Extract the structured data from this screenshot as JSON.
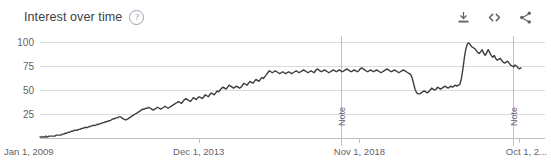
{
  "header": {
    "title": "Interest over time",
    "help_icon_glyph": "?",
    "help_icon_name": "help-icon",
    "actions": [
      {
        "name": "download-icon",
        "label": "download"
      },
      {
        "name": "embed-icon",
        "label": "embed"
      },
      {
        "name": "share-icon",
        "label": "share"
      }
    ]
  },
  "colors": {
    "line": "#3c4043",
    "gridline": "#dadce0",
    "axis": "#bdc1c6",
    "text": "#5f6368",
    "title": "#3c4043",
    "background": "#ffffff"
  },
  "annotations": [
    {
      "label": "Note",
      "x_value": 59.7
    },
    {
      "label": "Note",
      "x_value": 93.6
    }
  ],
  "chart_data": {
    "type": "line",
    "title": "Interest over time",
    "xlabel": "",
    "ylabel": "",
    "ylim": [
      0,
      100
    ],
    "grid": true,
    "legend": false,
    "y_ticks": [
      100,
      75,
      50,
      25
    ],
    "x_ticks": [
      "Jan 1, 2009",
      "Dec 1, 2013",
      "Nov 1, 2018",
      "Oct 1, 2..."
    ],
    "x_tick_positions": [
      0,
      33.0,
      66.4,
      99.6
    ],
    "series": [
      {
        "name": "Interest",
        "values": [
          1,
          1,
          1,
          1,
          2,
          1,
          2,
          2,
          2,
          2,
          2,
          3,
          3,
          3,
          3,
          4,
          4,
          5,
          5,
          6,
          6,
          7,
          7,
          8,
          8,
          8,
          9,
          9,
          10,
          10,
          11,
          11,
          11,
          12,
          12,
          13,
          13,
          13,
          14,
          14,
          15,
          15,
          16,
          16,
          17,
          17,
          18,
          18,
          19,
          20,
          20,
          21,
          21,
          22,
          22,
          21,
          20,
          19,
          19,
          20,
          21,
          22,
          23,
          24,
          25,
          26,
          27,
          28,
          29,
          30,
          30,
          31,
          31,
          32,
          31,
          30,
          29,
          30,
          31,
          32,
          31,
          30,
          31,
          32,
          33,
          32,
          31,
          32,
          33,
          34,
          35,
          36,
          37,
          38,
          37,
          36,
          38,
          40,
          41,
          40,
          39,
          38,
          40,
          42,
          41,
          40,
          42,
          43,
          42,
          41,
          43,
          45,
          44,
          43,
          45,
          47,
          46,
          45,
          47,
          49,
          48,
          50,
          52,
          53,
          52,
          51,
          53,
          55,
          54,
          53,
          52,
          53,
          54,
          53,
          52,
          53,
          55,
          57,
          56,
          55,
          57,
          59,
          58,
          57,
          59,
          61,
          60,
          59,
          61,
          63,
          62,
          64,
          66,
          68,
          70,
          69,
          68,
          69,
          70,
          69,
          68,
          67,
          68,
          69,
          68,
          67,
          68,
          69,
          68,
          67,
          68,
          69,
          70,
          69,
          68,
          69,
          70,
          71,
          70,
          69,
          68,
          69,
          70,
          69,
          68,
          70,
          72,
          71,
          70,
          69,
          70,
          71,
          70,
          69,
          68,
          69,
          70,
          71,
          70,
          69,
          70,
          71,
          70,
          69,
          70,
          71,
          72,
          71,
          70,
          69,
          70,
          71,
          70,
          69,
          70,
          72,
          73,
          72,
          71,
          70,
          69,
          70,
          71,
          70,
          69,
          70,
          71,
          70,
          69,
          68,
          69,
          70,
          71,
          72,
          71,
          70,
          69,
          70,
          71,
          70,
          69,
          68,
          69,
          70,
          71,
          70,
          69,
          68,
          67,
          66,
          62,
          56,
          50,
          47,
          46,
          46,
          47,
          48,
          49,
          48,
          47,
          48,
          50,
          52,
          51,
          50,
          51,
          53,
          52,
          51,
          52,
          53,
          54,
          53,
          52,
          53,
          54,
          53,
          54,
          55,
          54,
          55,
          56,
          62,
          72,
          84,
          93,
          98,
          99,
          97,
          95,
          94,
          93,
          91,
          89,
          88,
          90,
          92,
          88,
          86,
          89,
          92,
          89,
          86,
          84,
          86,
          83,
          81,
          82,
          83,
          81,
          79,
          78,
          79,
          80,
          78,
          76,
          75,
          74,
          76,
          75,
          73,
          72,
          73
        ]
      }
    ]
  }
}
